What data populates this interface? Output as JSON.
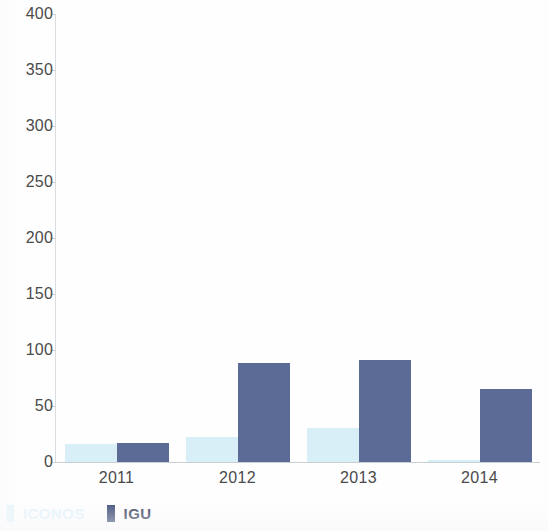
{
  "chart_data": {
    "type": "bar",
    "title": "",
    "subtitle": "",
    "xlabel": "",
    "ylabel": "",
    "categories": [
      "2011",
      "2012",
      "2013",
      "2014"
    ],
    "series": [
      {
        "name": "ICONOS",
        "color": "#d8eff8",
        "values": [
          16,
          22,
          30,
          2
        ]
      },
      {
        "name": "IGU",
        "color": "#5b6b96",
        "values": [
          17,
          88,
          91,
          65
        ]
      }
    ],
    "ylim": [
      0,
      400
    ],
    "yticks": [
      0,
      50,
      100,
      150,
      200,
      250,
      300,
      350,
      400
    ],
    "ytick_labels": [
      "0",
      "50",
      "100",
      "150",
      "200",
      "250",
      "300",
      "350",
      "400"
    ],
    "grid": false,
    "legend_position": "bottom-left"
  },
  "legend": {
    "items": [
      {
        "label": "ICONOS",
        "color": "#e2f4fb"
      },
      {
        "label": "IGU",
        "color": "#3f4e77"
      }
    ]
  },
  "colors": {
    "iconos": "#d8eff8",
    "igu": "#5b6b96",
    "axis": "#c9ced5",
    "tick_text": "#4a4a4a",
    "background": "#ffffff"
  }
}
